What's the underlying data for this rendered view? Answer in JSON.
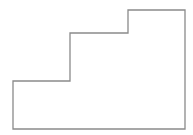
{
  "diagram": {
    "type": "stepped-outline",
    "stroke_color": "#8a8a8a",
    "stroke_width": 1.3,
    "fill_color": "#ffffff",
    "points": "13,81 70,81 70,33 128,33 128,10 185,10 185,129 13,129"
  }
}
